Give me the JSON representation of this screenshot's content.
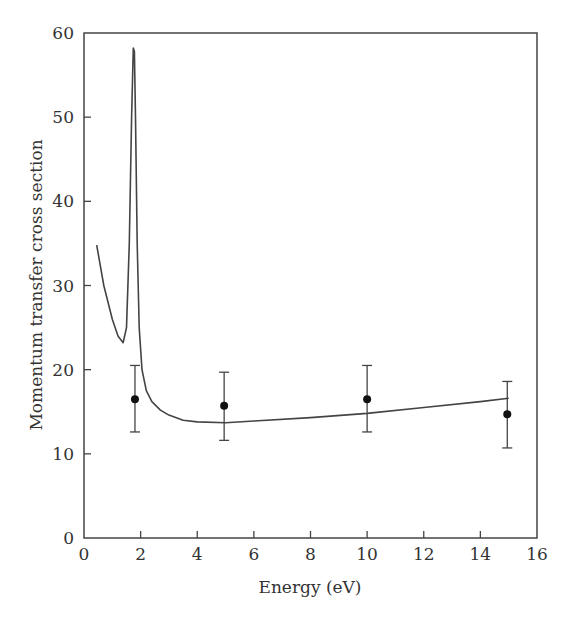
{
  "chart_data": {
    "type": "line",
    "title": "",
    "xlabel": "Energy (eV)",
    "ylabel": "Momentum transfer cross section",
    "xlim": [
      0,
      16
    ],
    "ylim": [
      0,
      60
    ],
    "x_ticks": [
      0,
      2,
      4,
      6,
      8,
      10,
      12,
      14,
      16
    ],
    "y_ticks": [
      0,
      10,
      20,
      30,
      40,
      50,
      60
    ],
    "grid": false,
    "legend": null,
    "series": [
      {
        "name": "theory curve",
        "style": "line",
        "x": [
          0.45,
          0.7,
          1.0,
          1.2,
          1.38,
          1.5,
          1.6,
          1.68,
          1.74,
          1.78,
          1.82,
          1.88,
          1.95,
          2.05,
          2.2,
          2.4,
          2.7,
          3.0,
          3.5,
          4.0,
          5.0,
          6.0,
          8.0,
          10.0,
          12.0,
          14.0,
          15.0
        ],
        "y": [
          34.8,
          30.0,
          26.0,
          24.0,
          23.2,
          25.0,
          35.0,
          50.0,
          58.2,
          57.8,
          50.0,
          35.0,
          25.0,
          20.0,
          17.5,
          16.2,
          15.2,
          14.6,
          14.0,
          13.8,
          13.7,
          13.9,
          14.3,
          14.8,
          15.5,
          16.2,
          16.6
        ]
      },
      {
        "name": "measurements",
        "style": "points-with-errorbars",
        "x": [
          1.8,
          4.95,
          10.0,
          14.95
        ],
        "y": [
          16.5,
          15.7,
          16.5,
          14.7
        ],
        "err_low": [
          12.6,
          11.6,
          12.6,
          10.7
        ],
        "err_high": [
          20.5,
          19.7,
          20.5,
          18.6
        ]
      }
    ]
  }
}
